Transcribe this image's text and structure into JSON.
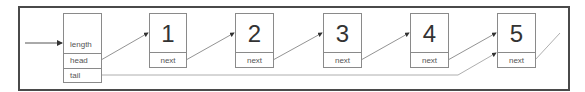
{
  "header": {
    "fields": [
      "length",
      "head",
      "tail"
    ]
  },
  "nodes": [
    {
      "value": "1",
      "pointer_label": "next"
    },
    {
      "value": "2",
      "pointer_label": "next"
    },
    {
      "value": "3",
      "pointer_label": "next"
    },
    {
      "value": "4",
      "pointer_label": "next"
    },
    {
      "value": "5",
      "pointer_label": "next"
    }
  ],
  "colors": {
    "frame": "#4a4a4a",
    "box_border": "#8a8a8a",
    "line": "#666666"
  }
}
